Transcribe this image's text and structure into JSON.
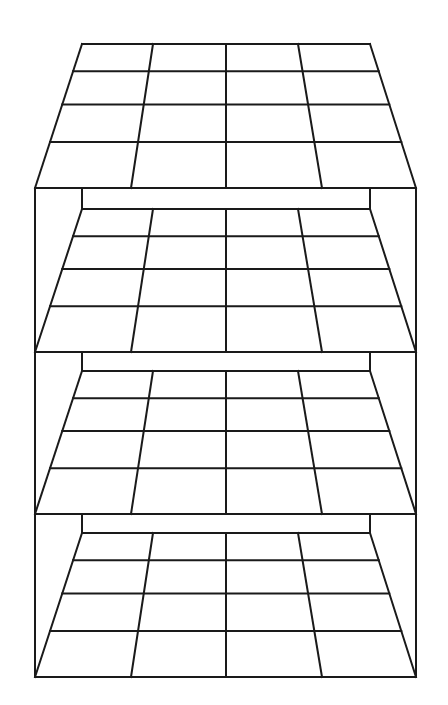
{
  "diagram": {
    "title": "Stacked perspective grids (4x4 layers in a frame)",
    "stroke_color": "#1a1a1a",
    "background": "#ffffff",
    "grid": {
      "rows": 4,
      "cols": 4,
      "back_x": [
        82,
        153,
        226,
        298,
        370
      ],
      "front_x": [
        35,
        131,
        226,
        322,
        416
      ],
      "row_fractions": [
        0.19,
        0.42,
        0.68
      ]
    },
    "layers": [
      {
        "name": "top",
        "back_y": 44,
        "front_y": 188
      },
      {
        "name": "second",
        "back_y": 209,
        "front_y": 352
      },
      {
        "name": "third",
        "back_y": 371,
        "front_y": 514
      },
      {
        "name": "bottom",
        "back_y": 533,
        "front_y": 677
      }
    ],
    "frame": {
      "left_x": 35,
      "right_x": 416,
      "top_y": 188,
      "bottom_y": 677,
      "inner_left_x": 82,
      "inner_right_x": 370
    }
  }
}
